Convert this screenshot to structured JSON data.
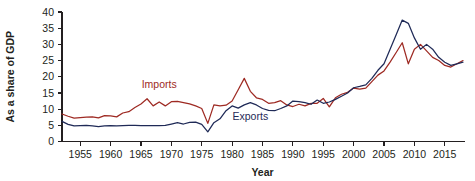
{
  "chart_data": {
    "type": "line",
    "title": "",
    "xlabel": "Year",
    "ylabel": "As a share of GDP",
    "xlim": [
      1952,
      2018
    ],
    "ylim": [
      0,
      40
    ],
    "grid": false,
    "legend_position": "inline-annotation",
    "yticks": [
      0,
      5,
      10,
      15,
      20,
      25,
      30,
      35,
      40
    ],
    "ytick_labels": [
      "0",
      "5",
      "10",
      "15",
      "20",
      "25",
      "30",
      "35",
      "40"
    ],
    "xticks": [
      1955,
      1960,
      1965,
      1970,
      1975,
      1980,
      1985,
      1990,
      1995,
      2000,
      2005,
      2010,
      2015
    ],
    "xtick_labels": [
      "1955",
      "1960",
      "1965",
      "1970",
      "1975",
      "1980",
      "1985",
      "1990",
      "1995",
      "2000",
      "2005",
      "2010",
      "2015"
    ],
    "x": [
      1952,
      1953,
      1954,
      1955,
      1956,
      1957,
      1958,
      1959,
      1960,
      1961,
      1962,
      1963,
      1964,
      1965,
      1966,
      1967,
      1968,
      1969,
      1970,
      1971,
      1972,
      1973,
      1974,
      1975,
      1976,
      1977,
      1978,
      1979,
      1980,
      1981,
      1982,
      1983,
      1984,
      1985,
      1986,
      1987,
      1988,
      1989,
      1990,
      1991,
      1992,
      1993,
      1994,
      1995,
      1996,
      1997,
      1998,
      1999,
      2000,
      2001,
      2002,
      2003,
      2004,
      2005,
      2006,
      2007,
      2008,
      2009,
      2010,
      2011,
      2012,
      2013,
      2014,
      2015,
      2016,
      2017,
      2018
    ],
    "series": [
      {
        "name": "Imports",
        "color": "#9e2a23",
        "label_x": 1968,
        "label_y": 16.5,
        "values": [
          8.5,
          7.8,
          7.2,
          7.4,
          7.5,
          7.6,
          7.3,
          8.0,
          7.9,
          7.6,
          8.8,
          9.2,
          10.5,
          11.6,
          13.2,
          11.0,
          12.2,
          11.0,
          12.3,
          12.4,
          12.0,
          11.6,
          11.0,
          10.2,
          5.6,
          11.3,
          11.0,
          11.2,
          12.5,
          16.0,
          19.5,
          15.5,
          13.5,
          13.0,
          11.8,
          12.0,
          12.6,
          11.3,
          10.8,
          11.5,
          11.0,
          11.8,
          11.8,
          13.3,
          10.7,
          13.5,
          14.6,
          15.2,
          16.5,
          16.2,
          16.5,
          18.5,
          20.5,
          21.8,
          24.5,
          27.5,
          30.5,
          24.0,
          28.5,
          30.0,
          28.0,
          26.0,
          25.0,
          23.5,
          23.0,
          24.0,
          25.0
        ]
      },
      {
        "name": "Exports",
        "color": "#1f2a57",
        "label_x": 1983,
        "label_y": 6.5,
        "values": [
          6.2,
          5.3,
          4.8,
          4.9,
          5.0,
          4.8,
          4.6,
          4.8,
          4.9,
          4.8,
          4.9,
          5.0,
          5.0,
          4.9,
          4.9,
          4.9,
          4.9,
          5.0,
          5.4,
          5.8,
          5.4,
          5.9,
          6.0,
          5.3,
          3.0,
          5.8,
          7.0,
          9.5,
          11.0,
          10.3,
          11.3,
          12.0,
          11.3,
          10.2,
          9.6,
          9.5,
          10.2,
          11.0,
          12.5,
          12.3,
          12.0,
          11.5,
          12.8,
          11.8,
          12.2,
          13.0,
          14.0,
          15.0,
          16.6,
          17.0,
          17.5,
          19.5,
          22.0,
          24.0,
          28.5,
          33.0,
          37.5,
          36.5,
          32.0,
          28.5,
          30.0,
          28.5,
          26.0,
          24.5,
          23.5,
          24.0,
          24.5
        ]
      }
    ]
  },
  "labels": {
    "y_axis_title": "As a share of GDP",
    "x_axis_title": "Year",
    "imports_label": "Imports",
    "exports_label": "Exports"
  },
  "colors": {
    "imports": "#9e2a23",
    "exports": "#1f2a57",
    "axis": "#231f20",
    "background": "#ffffff"
  }
}
